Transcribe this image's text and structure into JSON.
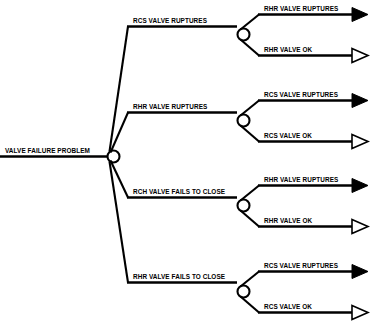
{
  "diagram": {
    "type": "event-tree",
    "background_color": "#ffffff",
    "line_color": "#000000",
    "root": {
      "label": "VALVE FAILURE PROBLEM"
    },
    "branches": [
      {
        "label": "RCS VALVE RUPTURES",
        "outcomes": [
          {
            "label": "RHR VALVE RUPTURES",
            "terminator": "filled-arrow"
          },
          {
            "label": "RHR VALVE OK",
            "terminator": "hollow-arrow"
          }
        ]
      },
      {
        "label": "RHR VALVE RUPTURES",
        "outcomes": [
          {
            "label": "RCS VALVE RUPTURES",
            "terminator": "filled-arrow"
          },
          {
            "label": "RCS VALVE OK",
            "terminator": "hollow-arrow"
          }
        ]
      },
      {
        "label": "RCH VALVE FAILS TO CLOSE",
        "outcomes": [
          {
            "label": "RHR VALVE RUPTURES",
            "terminator": "filled-arrow"
          },
          {
            "label": "RHR VALVE OK",
            "terminator": "hollow-arrow"
          }
        ]
      },
      {
        "label": "RHR VALVE FAILS TO CLOSE",
        "outcomes": [
          {
            "label": "RCS VALVE RUPTURES",
            "terminator": "filled-arrow"
          },
          {
            "label": "RCS VALVE OK",
            "terminator": "hollow-arrow"
          }
        ]
      }
    ]
  }
}
